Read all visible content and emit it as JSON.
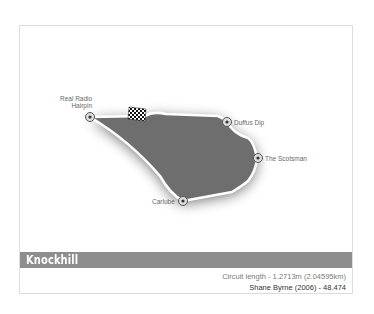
{
  "circuit": {
    "name": "Knockhill",
    "length_label": "Circuit length",
    "length_value": "1.2713m (2.04595km)",
    "length_line": "Circuit length  -  1.2713m (2.04595km)",
    "record_holder": "Shane Byrne",
    "record_year": "2006",
    "record_time": "48.474",
    "record_line": "Shane Byrne  (2006)  -  48.474"
  },
  "corners": [
    {
      "name": "Real Radio Hairpin",
      "line1": "Real Radio",
      "line2": "Hairpin"
    },
    {
      "name": "Duffus Dip"
    },
    {
      "name": "The Scotsman"
    },
    {
      "name": "Carlube"
    }
  ],
  "icons": {
    "start_finish": "checkered-flag-icon",
    "corner_marker": "corner-marker-icon"
  },
  "colors": {
    "track_fill": "#6e6e6e",
    "track_line": "#ffffff",
    "title_bar": "#8e8e8e",
    "frame_border": "#dcdcdc"
  }
}
